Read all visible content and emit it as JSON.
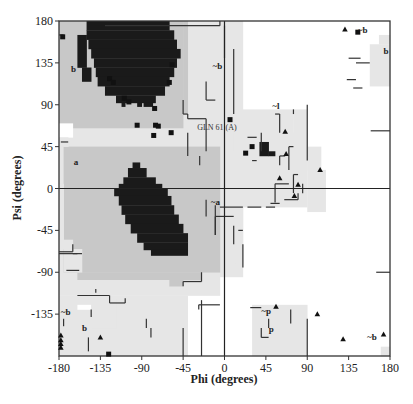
{
  "chart_data": {
    "type": "scatter",
    "xlabel": "Phi (degrees)",
    "ylabel": "Psi (degrees)",
    "xlim": [
      -180,
      180
    ],
    "ylim": [
      -180,
      180
    ],
    "xticks": [
      -180,
      -135,
      -90,
      -45,
      0,
      45,
      90,
      135,
      180
    ],
    "yticks": [
      180,
      135,
      90,
      45,
      0,
      -45,
      -90,
      -135
    ],
    "colors": {
      "most_favoured": "#1a1a1a",
      "additional_allowed": "#c8c8c8",
      "generously_allowed": "#e6e6e6",
      "disallowed": "#ffffff",
      "points": "#111111",
      "frame": "#333333"
    },
    "region_labels": [
      {
        "text": "b",
        "phi": -167,
        "psi": 128
      },
      {
        "text": "a",
        "phi": -164,
        "psi": 28
      },
      {
        "text": "~b",
        "phi": -178,
        "psi": -133
      },
      {
        "text": "b",
        "phi": -155,
        "psi": -150
      },
      {
        "text": "~b",
        "phi": -13,
        "psi": 132
      },
      {
        "text": "~a",
        "phi": -15,
        "psi": -14
      },
      {
        "text": "~l",
        "phi": 52,
        "psi": 89
      },
      {
        "text": "~p",
        "phi": 40,
        "psi": -132
      },
      {
        "text": "p",
        "phi": 48,
        "psi": -151
      },
      {
        "text": "~b",
        "phi": 145,
        "psi": 170
      },
      {
        "text": "b",
        "phi": 173,
        "psi": 148
      },
      {
        "text": "~b",
        "phi": 155,
        "psi": -160
      }
    ],
    "annotations": [
      {
        "text": "GLN 61 (A)",
        "phi": -8,
        "psi": 66
      }
    ],
    "glycine_triangles": [
      {
        "phi": 131,
        "psi": 171
      },
      {
        "phi": 66,
        "psi": 61
      },
      {
        "phi": 67,
        "psi": 37
      },
      {
        "phi": 104,
        "psi": 20
      },
      {
        "phi": 60,
        "psi": 11
      },
      {
        "phi": 80,
        "psi": 4
      },
      {
        "phi": 76,
        "psi": -8
      },
      {
        "phi": 56,
        "psi": -127
      },
      {
        "phi": 101,
        "psi": -135
      },
      {
        "phi": 129,
        "psi": -162
      },
      {
        "phi": 173,
        "psi": -157
      },
      {
        "phi": -178,
        "psi": -158
      },
      {
        "phi": -178,
        "psi": -163
      },
      {
        "phi": -178,
        "psi": -167
      },
      {
        "phi": -178,
        "psi": -171
      },
      {
        "phi": -135,
        "psi": -160
      }
    ],
    "residue_squares": [
      {
        "phi": -176,
        "psi": 163
      },
      {
        "phi": -57,
        "psi": 133
      },
      {
        "phi": -60,
        "psi": 114
      },
      {
        "phi": -125,
        "psi": 118
      },
      {
        "phi": -121,
        "psi": 114
      },
      {
        "phi": -104,
        "psi": 93
      },
      {
        "phi": -76,
        "psi": 86
      },
      {
        "phi": -75,
        "psi": 68
      },
      {
        "phi": -72,
        "psi": 67
      },
      {
        "phi": -95,
        "psi": 68
      },
      {
        "phi": -77,
        "psi": 57
      },
      {
        "phi": -58,
        "psi": 60
      },
      {
        "phi": 6,
        "psi": 74
      },
      {
        "phi": 30,
        "psi": 45
      },
      {
        "phi": 23,
        "psi": 38
      },
      {
        "phi": 145,
        "psi": 168
      },
      {
        "phi": -126,
        "psi": -178
      },
      {
        "phi": -109,
        "psi": 97
      }
    ]
  }
}
